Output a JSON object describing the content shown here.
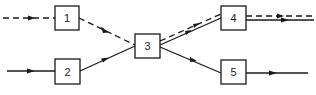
{
  "diagram": {
    "type": "flow",
    "nodes": [
      {
        "id": "1",
        "label": "1",
        "x": 55,
        "y": 6,
        "w": 24,
        "h": 24
      },
      {
        "id": "2",
        "label": "2",
        "x": 55,
        "y": 59,
        "w": 25,
        "h": 25
      },
      {
        "id": "3",
        "label": "3",
        "x": 135,
        "y": 34,
        "w": 25,
        "h": 24
      },
      {
        "id": "4",
        "label": "4",
        "x": 221,
        "y": 6,
        "w": 25,
        "h": 24
      },
      {
        "id": "5",
        "label": "5",
        "x": 221,
        "y": 60,
        "w": 25,
        "h": 24
      }
    ],
    "edges": [
      {
        "from": "input",
        "to": "1",
        "style": "dashed"
      },
      {
        "from": "input",
        "to": "2",
        "style": "solid"
      },
      {
        "from": "1",
        "to": "3",
        "style": "dashed"
      },
      {
        "from": "2",
        "to": "3",
        "style": "solid"
      },
      {
        "from": "3",
        "to": "4",
        "style": "dashed"
      },
      {
        "from": "3",
        "to": "4",
        "style": "solid"
      },
      {
        "from": "3",
        "to": "5",
        "style": "solid"
      },
      {
        "from": "4",
        "to": "output",
        "style": "dashed"
      },
      {
        "from": "4",
        "to": "output",
        "style": "solid"
      },
      {
        "from": "5",
        "to": "output",
        "style": "solid"
      }
    ]
  }
}
